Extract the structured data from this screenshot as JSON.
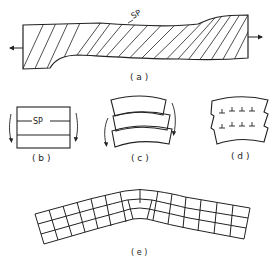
{
  "figure": {
    "panels": [
      {
        "id": "a",
        "label": "( a )",
        "annotation": "SP",
        "description": "Hatched deformed crystal with slip plane under tension"
      },
      {
        "id": "b",
        "label": "( b )",
        "annotation": "SP",
        "description": "Rectangular block with slip planes and shear arrows"
      },
      {
        "id": "c",
        "label": "( c )",
        "annotation": "",
        "description": "Three bent slabs sliding with shear arrows"
      },
      {
        "id": "d",
        "label": "( d )",
        "annotation": "",
        "description": "Bent crystal with stepped edges and edge dislocations"
      },
      {
        "id": "e",
        "label": "( e )",
        "annotation": "",
        "description": "Bent lattice grid with polygonization"
      }
    ],
    "colors": {
      "ink": "#222222",
      "background": "#ffffff"
    }
  }
}
